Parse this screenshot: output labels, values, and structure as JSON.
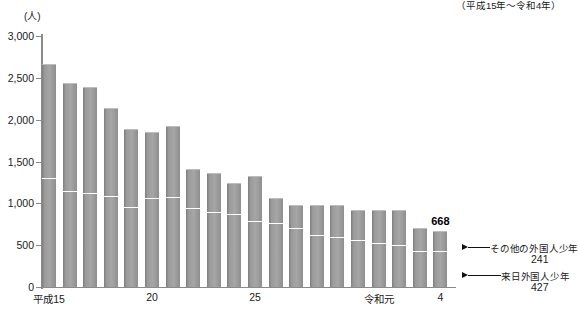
{
  "header": {
    "period_note": "（平成15年～令和4年）"
  },
  "axis": {
    "unit_label": "(人)",
    "y_ticks": [
      "3,000",
      "2,500",
      "2,000",
      "1,500",
      "1,000",
      "500",
      "0"
    ],
    "y_values": [
      3000,
      2500,
      2000,
      1500,
      1000,
      500,
      0
    ],
    "x_labels": [
      {
        "text": "平成15",
        "index": 0
      },
      {
        "text": "20",
        "index": 5
      },
      {
        "text": "25",
        "index": 10
      },
      {
        "text": "令和元",
        "index": 16
      },
      {
        "text": "4",
        "index": 19
      }
    ]
  },
  "annotations": {
    "total_label": "668",
    "top_series_name": "その他の外国人少年",
    "top_series_value": "241",
    "bottom_series_name": "来日外国人少年",
    "bottom_series_value": "427"
  },
  "colors": {
    "bar_fill": "#9a9a9a",
    "bar_edge": "#7d7d7d",
    "axis": "#8a8a8a",
    "divider": "#ffffff",
    "text": "#1a1a1a"
  },
  "chart_data": {
    "type": "bar",
    "stacked": true,
    "title": "",
    "subtitle": "（平成15年～令和4年）",
    "xlabel": "",
    "ylabel": "(人)",
    "ylim": [
      0,
      3000
    ],
    "ytick_step": 500,
    "grid": false,
    "legend": "none",
    "categories": [
      "平成15",
      "16",
      "17",
      "18",
      "19",
      "20",
      "21",
      "22",
      "23",
      "24",
      "25",
      "26",
      "27",
      "28",
      "29",
      "30",
      "令和元",
      "2",
      "3",
      "4"
    ],
    "series": [
      {
        "name": "来日外国人少年",
        "values": [
          1308,
          1150,
          1120,
          1090,
          960,
          1060,
          1070,
          950,
          900,
          870,
          790,
          760,
          700,
          620,
          600,
          560,
          530,
          500,
          430,
          427
        ]
      },
      {
        "name": "その他の外国人少年",
        "values": [
          1362,
          1285,
          1265,
          1055,
          925,
          790,
          860,
          455,
          460,
          375,
          540,
          305,
          275,
          355,
          375,
          360,
          395,
          425,
          270,
          241
        ]
      }
    ],
    "totals": [
      2670,
      2435,
      2385,
      2145,
      1885,
      1850,
      1930,
      1405,
      1360,
      1245,
      1330,
      1065,
      975,
      975,
      975,
      920,
      925,
      925,
      700,
      668
    ],
    "annotations": [
      {
        "text": "668",
        "category": "4",
        "type": "data-label"
      },
      {
        "text": "その他の外国人少年 241",
        "category": "4",
        "type": "callout"
      },
      {
        "text": "来日外国人少年 427",
        "category": "4",
        "type": "callout"
      }
    ]
  }
}
